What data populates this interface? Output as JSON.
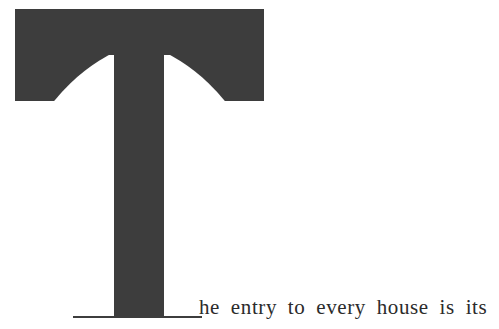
{
  "page": {
    "background_color": "#ffffff",
    "width": 499,
    "height": 329
  },
  "dropcap": {
    "letter": "T",
    "color": "#3d3d3d",
    "style": "serif-slab-bracketed"
  },
  "paragraph": {
    "full_sentence": "The entry to every house is its",
    "continuation_text": "he entry to every house is its",
    "color": "#2b2b2b"
  },
  "words": [
    "he",
    "entry",
    "to",
    "every",
    "house",
    "is",
    "its"
  ]
}
